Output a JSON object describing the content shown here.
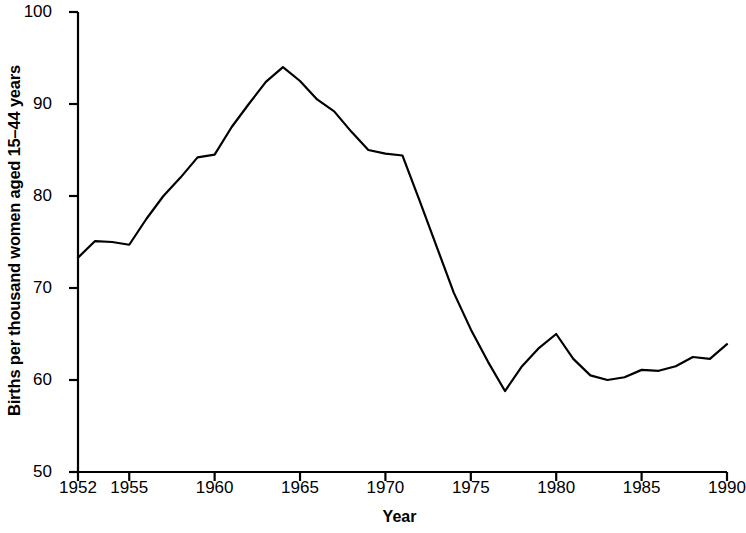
{
  "chart_data": {
    "type": "line",
    "title": "",
    "subtitle": "",
    "xlabel": "Year",
    "ylabel": "Births per thousand women aged 15–44 years",
    "xlim": [
      1952,
      1990
    ],
    "ylim": [
      50,
      100
    ],
    "grid": false,
    "legend": "none",
    "line_color": "#000000",
    "background_color": "#ffffff",
    "x_ticks": [
      1952,
      1955,
      1960,
      1965,
      1970,
      1975,
      1980,
      1985,
      1990
    ],
    "x_tick_labels": [
      "1952",
      "1955",
      "1960",
      "1965",
      "1970",
      "1975",
      "1980",
      "1985",
      "1990"
    ],
    "y_ticks": [
      50,
      60,
      70,
      80,
      90,
      100
    ],
    "y_tick_labels": [
      "50",
      "60",
      "70",
      "80",
      "90",
      "100"
    ],
    "x": [
      1952,
      1953,
      1954,
      1955,
      1956,
      1957,
      1958,
      1959,
      1960,
      1961,
      1962,
      1963,
      1964,
      1965,
      1966,
      1967,
      1968,
      1969,
      1970,
      1971,
      1972,
      1973,
      1974,
      1975,
      1976,
      1977,
      1978,
      1979,
      1980,
      1981,
      1982,
      1983,
      1984,
      1985,
      1986,
      1987,
      1988,
      1989,
      1990
    ],
    "values": [
      73.3,
      75.1,
      75.0,
      74.7,
      77.5,
      80.0,
      82.0,
      84.2,
      84.5,
      87.5,
      90.0,
      92.4,
      94.0,
      92.5,
      90.5,
      89.2,
      87.0,
      85.0,
      84.6,
      84.4,
      79.5,
      74.5,
      69.5,
      65.5,
      62.0,
      58.8,
      61.5,
      63.5,
      65.0,
      62.3,
      60.5,
      60.0,
      60.3,
      61.1,
      61.0,
      61.5,
      62.5,
      62.3,
      63.9
    ],
    "series": [
      {
        "name": "General fertility rate",
        "values": [
          73.3,
          75.1,
          75.0,
          74.7,
          77.5,
          80.0,
          82.0,
          84.2,
          84.5,
          87.5,
          90.0,
          92.4,
          94.0,
          92.5,
          90.5,
          89.2,
          87.0,
          85.0,
          84.6,
          84.4,
          79.5,
          74.5,
          69.5,
          65.5,
          62.0,
          58.8,
          61.5,
          63.5,
          65.0,
          62.3,
          60.5,
          60.0,
          60.3,
          61.1,
          61.0,
          61.5,
          62.5,
          62.3,
          63.9
        ]
      }
    ]
  }
}
